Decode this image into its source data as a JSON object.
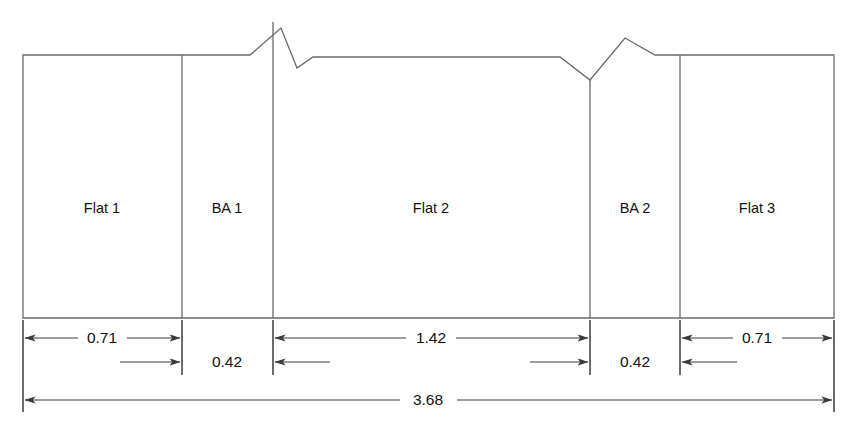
{
  "diagram": {
    "units_note": "",
    "line_color": "#6a6a6a",
    "dimension_color": "#3a3a3a",
    "text_color": "#111111",
    "background_color": "#ffffff",
    "segments": [
      {
        "id": "flat-1",
        "label": "Flat 1",
        "kind": "flat",
        "x_start": 23,
        "x_end": 182,
        "center_x": 102
      },
      {
        "id": "ba-1",
        "label": "BA 1",
        "kind": "bend-allowance",
        "x_start": 182,
        "x_end": 273,
        "center_x": 227
      },
      {
        "id": "flat-2",
        "label": "Flat 2",
        "kind": "flat",
        "x_start": 273,
        "x_end": 590,
        "center_x": 431
      },
      {
        "id": "ba-2",
        "label": "BA 2",
        "kind": "bend-allowance",
        "x_start": 590,
        "x_end": 680,
        "center_x": 635
      },
      {
        "id": "flat-3",
        "label": "Flat 3",
        "kind": "flat",
        "x_start": 680,
        "x_end": 834,
        "center_x": 757
      }
    ],
    "dimensions": [
      {
        "id": "dim-flat-1",
        "value": "0.71",
        "x_start": 23,
        "x_end": 182,
        "row": 1,
        "label_x": 102,
        "label_y": 338,
        "arrow_style": "inward"
      },
      {
        "id": "dim-ba-1",
        "value": "0.42",
        "x_start": 182,
        "x_end": 273,
        "row": 2,
        "label_x": 227,
        "label_y": 362,
        "arrow_style": "outward"
      },
      {
        "id": "dim-flat-2",
        "value": "1.42",
        "x_start": 273,
        "x_end": 590,
        "row": 1,
        "label_x": 431,
        "label_y": 338,
        "arrow_style": "inward"
      },
      {
        "id": "dim-ba-2",
        "value": "0.42",
        "x_start": 590,
        "x_end": 680,
        "row": 2,
        "label_x": 635,
        "label_y": 362,
        "arrow_style": "outward"
      },
      {
        "id": "dim-flat-3",
        "value": "0.71",
        "x_start": 680,
        "x_end": 834,
        "row": 1,
        "label_x": 757,
        "label_y": 338,
        "arrow_style": "inward"
      },
      {
        "id": "dim-overall",
        "value": "3.68",
        "x_start": 23,
        "x_end": 834,
        "row": 3,
        "label_x": 428,
        "label_y": 400,
        "arrow_style": "inward"
      }
    ],
    "break_lines": [
      {
        "id": "break-1",
        "type": "zigzag-up-down",
        "peak_x": 281,
        "peak_y": 28,
        "valley_x": 297,
        "valley_y": 68
      },
      {
        "id": "break-2",
        "type": "zigzag-down-up",
        "valley_x": 590,
        "valley_y": 80,
        "peak_x": 625,
        "peak_y": 38
      }
    ],
    "geometry": {
      "top_y": 55,
      "bottom_y": 318,
      "left_x": 23,
      "right_x": 834,
      "dim_row1_y": 338,
      "dim_row2_y": 362,
      "dim_row3_y": 400,
      "ext_top_y": 320,
      "ext_bottom_y": 412
    }
  }
}
